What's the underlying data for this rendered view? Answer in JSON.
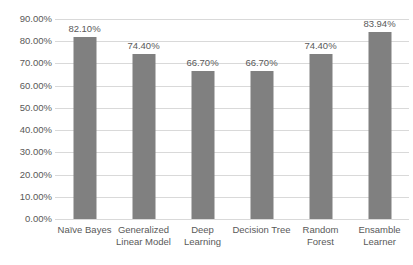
{
  "chart_data": {
    "type": "bar",
    "title": "",
    "subtitle": "",
    "xlabel": "",
    "ylabel": "",
    "categories": [
      "Naïve Bayes",
      "Generalized Linear Model",
      "Deep Learning",
      "Decision Tree",
      "Random Forest",
      "Ensamble Learner"
    ],
    "category_lines": [
      [
        "Naïve Bayes"
      ],
      [
        "Generalized",
        "Linear Model"
      ],
      [
        "Deep",
        "Learning"
      ],
      [
        "Decision Tree"
      ],
      [
        "Random",
        "Forest"
      ],
      [
        "Ensamble",
        "Learner"
      ]
    ],
    "values": [
      82.1,
      74.4,
      66.7,
      66.7,
      74.4,
      83.94
    ],
    "data_labels": [
      "82.10%",
      "74.40%",
      "66.70%",
      "66.70%",
      "74.40%",
      "83.94%"
    ],
    "ylim": [
      0,
      90
    ],
    "ytick_step": 10,
    "ytick_labels": [
      "90.00%",
      "80.00%",
      "70.00%",
      "60.00%",
      "50.00%",
      "40.00%",
      "30.00%",
      "20.00%",
      "10.00%",
      "0.00%"
    ],
    "ytick_values": [
      90,
      80,
      70,
      60,
      50,
      40,
      30,
      20,
      10,
      0
    ],
    "grid": true,
    "legend": false,
    "legend_position": "none",
    "bar_color": "#808080",
    "gridline_color": "#D9D9D9",
    "text_color": "#595959",
    "background_color": "#FFFFFF"
  }
}
